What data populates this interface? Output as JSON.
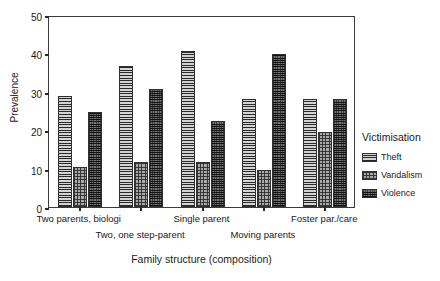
{
  "chart_data": {
    "type": "bar",
    "title": "",
    "xlabel": "Family structure (composition)",
    "ylabel": "Prevalence",
    "ylim": [
      0,
      50
    ],
    "yticks": [
      0,
      10,
      20,
      30,
      40,
      50
    ],
    "grid": false,
    "legend_position": "right",
    "legend_title": "Victimisation",
    "categories": [
      "Two parents, biologi",
      "Two, one step-parent",
      "Single parent",
      "Moving parents",
      "Foster par./care"
    ],
    "category_rows": [
      0,
      1,
      0,
      1,
      0
    ],
    "series": [
      {
        "name": "Theft",
        "pattern": "horizontal-lines",
        "values": [
          29.0,
          36.7,
          40.5,
          28.0,
          28.0
        ]
      },
      {
        "name": "Vandalism",
        "pattern": "light-grid",
        "values": [
          10.3,
          11.8,
          11.7,
          9.7,
          19.5
        ]
      },
      {
        "name": "Violence",
        "pattern": "dark-grid",
        "values": [
          24.8,
          30.7,
          22.5,
          39.8,
          28.0
        ]
      }
    ]
  },
  "colors": {
    "axis": "#3b3b3b",
    "text": "#1a1a1a",
    "theft": "#9a9a9a",
    "vandalism": "#a9a9a9",
    "violence": "#4a4a4a",
    "background": "#ffffff"
  }
}
